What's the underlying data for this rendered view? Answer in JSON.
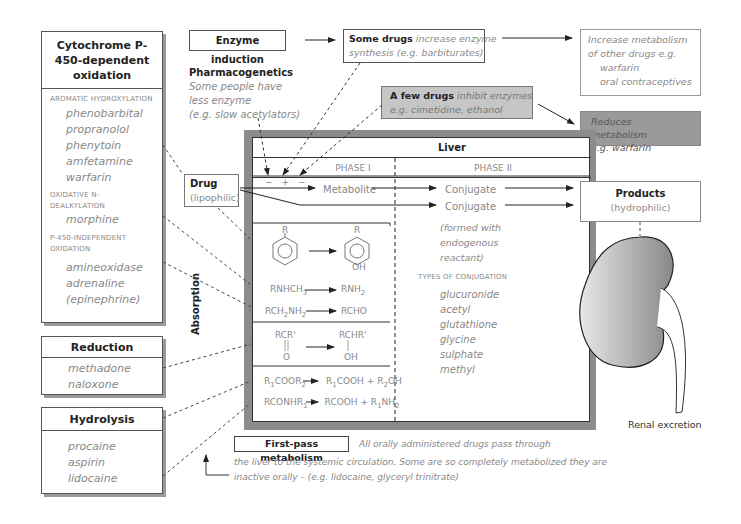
{
  "cytochrome_box": {
    "title": "Cytochrome P-450-dependent oxidation",
    "sections": [
      {
        "heading": "AROMATIC HYDROXYLATION",
        "items": [
          "phenobarbital",
          "propranolol",
          "phenytoin",
          "amfetamine",
          "warfarin"
        ]
      },
      {
        "heading": "OXIDATIVE N-DEALKYLATION",
        "items": [
          "morphine"
        ]
      },
      {
        "heading": "P-450-INDEPENDENT OXIDATION",
        "items": [
          "amineoxidase",
          "adrenaline",
          "(epinephrine)"
        ]
      }
    ]
  },
  "reduction_box": {
    "title": "Reduction",
    "items": [
      "methadone",
      "naloxone"
    ]
  },
  "hydrolysis_box": {
    "title": "Hydrolysis",
    "items": [
      "procaine",
      "aspirin",
      "lidocaine"
    ]
  },
  "enzyme_induction": {
    "label": "Enzyme induction"
  },
  "pharmacogenetics": {
    "title": "Pharmacogenetics",
    "lines": [
      "Some people have",
      "less enzyme",
      "(e.g. slow acetylators)"
    ]
  },
  "some_drugs": {
    "bold": "Some drugs",
    "text1": " increase enzyme",
    "text2": "synthesis (e.g. barbiturates)"
  },
  "increase_metabolism": {
    "lines": [
      "Increase metabolism",
      "of other drugs e.g.",
      "warfarin",
      "oral contraceptives"
    ]
  },
  "few_drugs": {
    "bold": "A few drugs",
    "text1": " inhibit enzymes",
    "text2": "e.g. cimetidine, ethanol"
  },
  "reduces_metabolism": {
    "lines": [
      "Reduces metabolism",
      "e.g. warfarin"
    ]
  },
  "drug_box": {
    "title": "Drug",
    "subtitle": "(lipophilic)"
  },
  "liver": {
    "title": "Liver",
    "phase1": "PHASE I",
    "phase2": "PHASE II",
    "signs": [
      "−",
      "+",
      "−"
    ],
    "metabolite": "Metabolite",
    "conjugate1": "Conjugate",
    "conjugate2": "Conjugate",
    "formed_with": [
      "(formed with",
      "endogenous",
      "reactant)"
    ],
    "types_heading": "TYPES OF CONJUGATION",
    "types": [
      "glucuronide",
      "acetyl",
      "glutathione",
      "glycine",
      "sulphate",
      "methyl"
    ],
    "benzene_r1": "R",
    "benzene_r2": "R",
    "benzene_oh": "OH",
    "reactions": {
      "r1_left": "RNHCH3",
      "r1_right": "RNH2",
      "r2_left": "RCH2NH2",
      "r2_right": "RCHO",
      "r3_left_top": "RCR'",
      "r3_left_bottom": "O",
      "r3_right_top": "RCHR'",
      "r3_right_bottom": "OH",
      "r4": "R1COOR2 → R1COOH + R2OH",
      "r5": "RCONHR1 → RCOOH + R1NH2"
    }
  },
  "absorption": "Absorption",
  "products_box": {
    "title": "Products",
    "subtitle": "(hydrophilic)"
  },
  "renal_excretion": "Renal excretion",
  "first_pass": {
    "label": "First-pass metabolism",
    "line1": "All orally administered drugs pass through",
    "line2": "the liver to the systemic circulation.  Some are so completely metabolized they are",
    "line3": "inactive orally – (e.g. lidocaine, glyceryl trinitrate)"
  }
}
